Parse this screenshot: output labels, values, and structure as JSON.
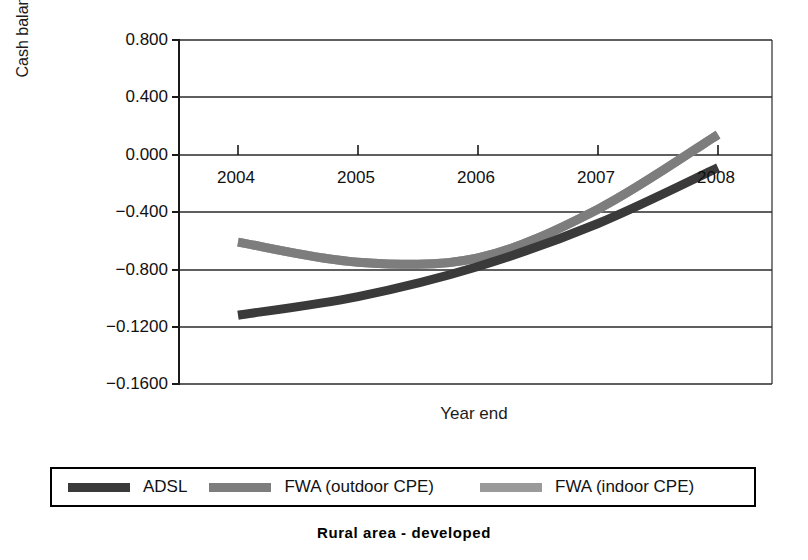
{
  "chart_data": {
    "type": "line",
    "title": "",
    "caption": "Rural area - developed",
    "xlabel": "Year end",
    "ylabel": "Cash balance (ME)",
    "grid": true,
    "legend_position": "bottom",
    "x_categories": [
      "2004",
      "2005",
      "2006",
      "2007",
      "2008"
    ],
    "y_ticklabels": [
      "0.800",
      "0.400",
      "0.000",
      "-0.400",
      "-0.800",
      "-0.1200",
      "-0.1600"
    ],
    "y_tickvalues": [
      0.8,
      0.4,
      0.0,
      -0.4,
      -0.8,
      -1.2,
      -1.6
    ],
    "ylim": [
      -1.6,
      0.8
    ],
    "series": [
      {
        "name": "ADSL",
        "color": "#3a3a3a",
        "x": [
          "2004",
          "2005",
          "2006",
          "2007",
          "2008"
        ],
        "values": [
          -1.12,
          -0.99,
          -0.78,
          -0.48,
          -0.09
        ]
      },
      {
        "name": "FWA (outdoor CPE)",
        "color": "#7d7d7d",
        "x": [
          "2004",
          "2005",
          "2006",
          "2007",
          "2008"
        ],
        "values": [
          -0.61,
          -0.75,
          -0.72,
          -0.38,
          0.14
        ]
      },
      {
        "name": "FWA (indoor CPE)",
        "color": "#9a9a9a",
        "x": [
          "2004",
          "2005",
          "2006",
          "2007",
          "2008"
        ],
        "values": [
          -0.61,
          -0.75,
          -0.72,
          -0.38,
          0.14
        ]
      }
    ]
  },
  "axes": {
    "y_title": "Cash balance (ME)",
    "x_title": "Year end",
    "y_ticks": [
      {
        "label": "0.800",
        "y": 40
      },
      {
        "label": "0.400",
        "y": 97
      },
      {
        "label": "0.000",
        "y": 155
      },
      {
        "label": "-0.400",
        "y": 212
      },
      {
        "label": "-0.800",
        "y": 270
      },
      {
        "label": "-0.1200",
        "y": 327
      },
      {
        "label": "-0.1600",
        "y": 384
      }
    ],
    "x_ticks": [
      {
        "label": "2004",
        "x": 58
      },
      {
        "label": "2005",
        "x": 178
      },
      {
        "label": "2006",
        "x": 298
      },
      {
        "label": "2007",
        "x": 418
      },
      {
        "label": "2008",
        "x": 538
      }
    ]
  },
  "legend": {
    "entries": [
      {
        "label": "ADSL",
        "color": "#3a3a3a"
      },
      {
        "label": "FWA (outdoor CPE)",
        "color": "#7d7d7d"
      },
      {
        "label": "FWA (indoor CPE)",
        "color": "#9a9a9a"
      }
    ]
  },
  "caption": {
    "text": "Rural area - developed"
  },
  "colors": {
    "axis": "#1a1a1a",
    "grid": "#2a2a2a",
    "text": "#111111",
    "background": "#ffffff"
  }
}
